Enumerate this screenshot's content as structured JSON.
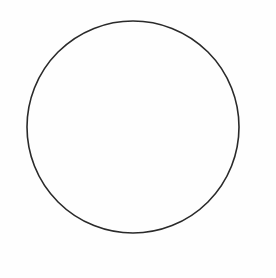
{
  "diagram": {
    "shapes": [
      {
        "type": "circle",
        "cx": 133,
        "cy": 127,
        "r": 106,
        "stroke": "#2a2a2a",
        "stroke_width": 1.6,
        "fill": "none"
      }
    ]
  },
  "colors": {
    "background": "#fefefe",
    "stroke": "#2a2a2a"
  }
}
